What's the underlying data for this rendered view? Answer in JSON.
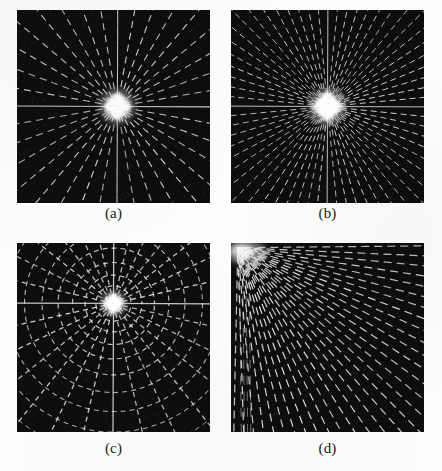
{
  "figure": {
    "kind": "figure-grid",
    "rows": 2,
    "cols": 2,
    "page_background": "#fdfdfc",
    "panel_background": "#0c0c0c",
    "pattern_color": "#f2f2f2"
  },
  "panels": [
    {
      "id": "panel-a",
      "caption": "(a)",
      "x": 17,
      "y": 10,
      "width": 193,
      "height": 193,
      "caption_y": 205,
      "pattern": "radial-star-dashed",
      "description": "Fourier spectrum: radial rays of dashed bright segments emanating from a bright saturated center on a dark background",
      "rays": 36,
      "center": {
        "cx": 0.52,
        "cy": 0.5
      },
      "center_glow_radius": 15,
      "dash_pattern": "7 5",
      "axes_solid": true,
      "ray_thickness": 1.1
    },
    {
      "id": "panel-b",
      "caption": "(b)",
      "x": 231,
      "y": 10,
      "width": 193,
      "height": 193,
      "caption_y": 205,
      "pattern": "radial-star-dashed-dense",
      "description": "Fourier spectrum with twice the ray count; diamond shaped bright core, dashed rays, solid horizontal and vertical axes",
      "rays": 64,
      "center": {
        "cx": 0.5,
        "cy": 0.5
      },
      "center_glow_radius": 16,
      "dash_pattern": "6 4",
      "axes_solid": true,
      "ray_thickness": 1.0
    },
    {
      "id": "panel-c",
      "caption": "(c)",
      "x": 17,
      "y": 243,
      "width": 193,
      "height": 189,
      "caption_y": 440,
      "pattern": "polar-grid-rings",
      "description": "Polar grid spectrum: concentric dashed rings crossed by radial spokes, rings increasingly dense toward the bright center",
      "rays": 28,
      "rings": 11,
      "center": {
        "cx": 0.5,
        "cy": 0.32
      },
      "center_glow_radius": 11,
      "dash_pattern": "5 4",
      "axes_solid": true,
      "ray_thickness": 1.3
    },
    {
      "id": "panel-d",
      "caption": "(d)",
      "x": 231,
      "y": 243,
      "width": 193,
      "height": 189,
      "caption_y": 440,
      "pattern": "corner-radial-quadrant",
      "description": "Quadrant of a radial pattern: dashed rays fanning out from the upper-left corner, bright blurred convergence region at the corner",
      "rays": 30,
      "center": {
        "cx": 0.035,
        "cy": 0.025
      },
      "center_glow_radius": 20,
      "dash_pattern": "8 5",
      "axes_solid": false,
      "ray_thickness": 1.2
    }
  ],
  "captions": {
    "a": "(a)",
    "b": "(b)",
    "c": "(c)",
    "d": "(d)"
  }
}
